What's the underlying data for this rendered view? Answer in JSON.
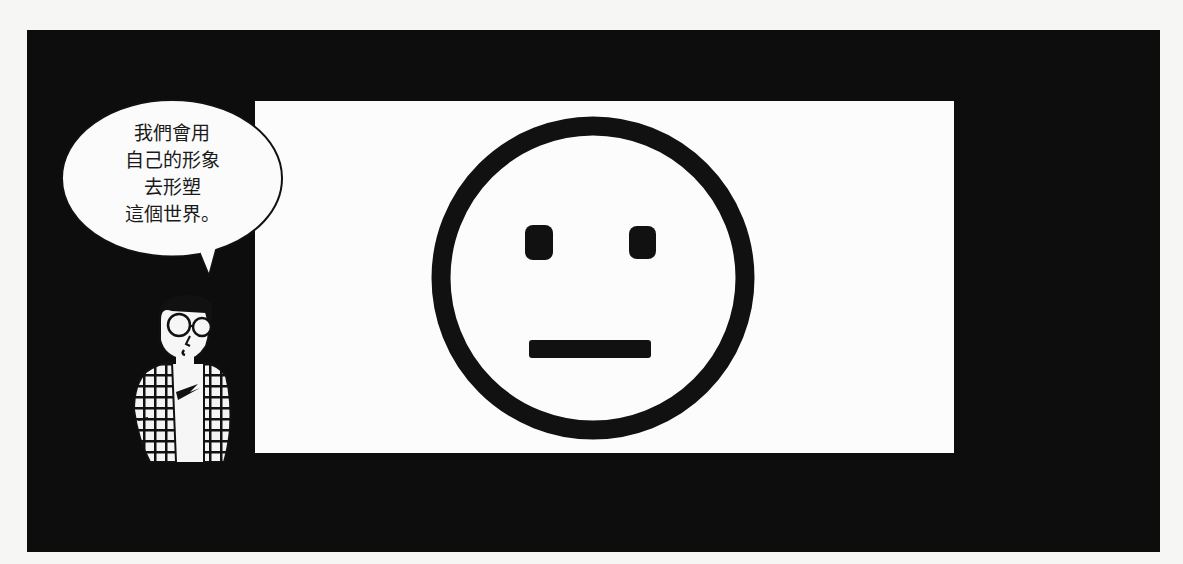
{
  "panel": {
    "background_color": "#0d0d0d",
    "screen_color": "#fcfcfc"
  },
  "speech_bubble": {
    "lines": [
      "我們會用",
      "自己的形象",
      "去形塑",
      "這個世界。"
    ]
  },
  "screen": {
    "content": "neutral-face-icon",
    "expression": "neutral"
  },
  "character": {
    "description": "narrator with round glasses and plaid jacket"
  }
}
